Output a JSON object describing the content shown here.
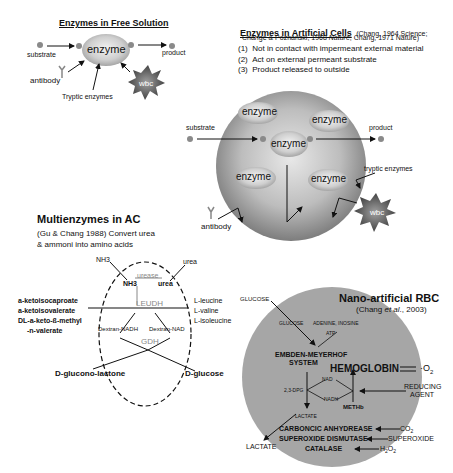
{
  "panel_free_solution": {
    "title": "Enzymes in Free Solution",
    "enzyme_label": "enzyme",
    "substrate_label": "substrate",
    "product_label": "product",
    "antibody_label": "antibody",
    "tryptic_label": "Tryptic enzymes",
    "wbc_label": "wbc"
  },
  "panel_artificial_cells": {
    "title": "Enzymes in Artificial Cells",
    "citation_line1": "(Chang, 1964 Science;",
    "citation_line2_a": "Change & Poznanski, 1968 ",
    "citation_line2_b": "Nature",
    "citation_line2_c": "; Chang, 1971 Nature)",
    "points": [
      {
        "num": "(1)",
        "text": "Not in contact with impermeant external material"
      },
      {
        "num": "(2)",
        "text": "Act on external permeant substrate"
      },
      {
        "num": "(3)",
        "text": "Product released to outside"
      }
    ],
    "enzymes": [
      "enzyme",
      "enzyme",
      "enzyme",
      "enzyme",
      "enzyme"
    ],
    "substrate_label": "substrate",
    "product_label": "product",
    "tryptic_label": "tryptic enzymes",
    "antibody_label": "antibody",
    "wbc_label": "wbc"
  },
  "panel_multienzymes": {
    "title": "Multienzymes in AC",
    "subtitle_line1": "(Gu & Chang 1988) Convert urea",
    "subtitle_line2": "& ammoni into amino acids",
    "nh3_outer": "NH3",
    "urea_outer": "urea",
    "urease": "urease",
    "nh3_inner": "NH3",
    "urea_inner": "urea",
    "leudh": "LEUDH",
    "left_substrates": [
      "a-ketoisocaproate",
      "a-ketoisovalerate",
      "DL-a-keto-ß-methyl",
      "-n-valerate"
    ],
    "right_products": [
      "L-leucine",
      "L-valine",
      "L-isoleucine"
    ],
    "dextran_nadh": "Dextran-NADH",
    "dextran_nad": "Dextran-NAD",
    "gdh": "GDH",
    "gluconolactone": "D-glucono-lactone",
    "glucose": "D-glucose"
  },
  "panel_nano_rbc": {
    "title": "Nano-artificial RBC",
    "citation_a": "(Chang ",
    "citation_b": "et al",
    "citation_c": "., 2003)",
    "glucose_outer": "GLUCOSE",
    "glucose_inner": "GLUCOSE",
    "adenine": "ADENINE, INOSINE",
    "atp": "ATP",
    "embden_line1": "EMBDEN-MEYERHOF",
    "embden_line2": "SYSTEM",
    "hemoglobin": "HEMOGLOBIN",
    "o2": "O",
    "o2_sub": "2",
    "nad": "NAD",
    "dpg": "2,3-DPG",
    "nadh": "NADH",
    "reducing_line1": "REDUCING",
    "reducing_line2": "AGENT",
    "methb": "METHb",
    "lactate_inner": "LACTATE",
    "lactate_outer": "LACTATE",
    "carbonic": "CARBONCIC ANHYDREASE",
    "co2": "CO",
    "co2_sub": "2",
    "superoxide_dismutase": "SUPEROXIDE DISMUTASE",
    "superoxide": "SUPEROXIDE",
    "catalase": "CATALASE",
    "h2o2_a": "H",
    "h2o2_b": "2",
    "h2o2_c": "O",
    "h2o2_d": "2"
  }
}
